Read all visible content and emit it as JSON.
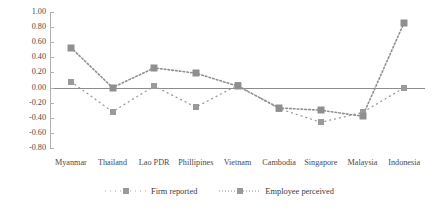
{
  "chart_data": {
    "type": "line",
    "title": "",
    "xlabel": "",
    "ylabel": "",
    "ylim": [
      -0.8,
      1.0
    ],
    "grid": false,
    "legend_position": "bottom-center",
    "categories": [
      "Myanmar",
      "Thailand",
      "Lao PDR",
      "Phillipines",
      "Vietnam",
      "Cambodia",
      "Singapore",
      "Malaysia",
      "Indonesia"
    ],
    "ytick_labels": [
      "1.00",
      "0.80",
      "0.60",
      "0.40",
      "0.20",
      "0.00",
      "-0.20",
      "-0.40",
      "-0.60",
      "-0.80"
    ],
    "ytick_values": [
      1.0,
      0.8,
      0.6,
      0.4,
      0.2,
      0.0,
      -0.2,
      -0.4,
      -0.6,
      -0.8
    ],
    "series": [
      {
        "name": "Firm reported",
        "style": "sparse-dotted",
        "color": "#9a9a9a",
        "values": [
          0.08,
          -0.32,
          0.02,
          -0.26,
          0.03,
          -0.28,
          -0.46,
          -0.33,
          0.0
        ]
      },
      {
        "name": "Employee perceived",
        "style": "dense-dotted",
        "color": "#8f8f8f",
        "values": [
          0.53,
          0.0,
          0.26,
          0.19,
          0.02,
          -0.27,
          -0.3,
          -0.38,
          0.86
        ]
      }
    ]
  },
  "legend": {
    "items": [
      {
        "label": "Firm reported",
        "icon": "dotted-square-marker-icon"
      },
      {
        "label": "Employee perceived",
        "icon": "dotted-square-marker-icon"
      }
    ]
  }
}
